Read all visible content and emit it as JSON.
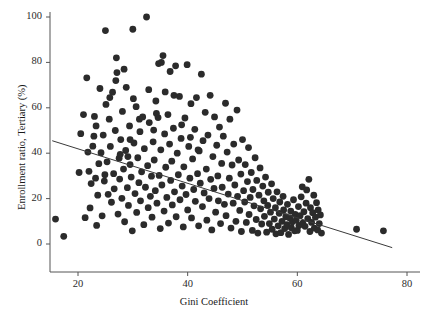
{
  "chart_data": {
    "type": "scatter",
    "title": "",
    "xlabel": "Gini Coefficient",
    "ylabel": "Enrollment ratio, Tertiary (%)",
    "xlim": [
      14,
      80
    ],
    "ylim": [
      -5,
      103
    ],
    "xticks": [
      20,
      40,
      60,
      80
    ],
    "yticks": [
      0,
      20,
      40,
      60,
      80,
      100
    ],
    "grid": false,
    "legend": null,
    "marker_color": "#2b2b2b",
    "marker_size": 4.4,
    "axis_color": "#555555",
    "trendline": {
      "label": "linear fit",
      "color": "#3a3a3a",
      "x": [
        15.3,
        77.3
      ],
      "y": [
        45.5,
        -1.6
      ],
      "slope": -0.76,
      "intercept": 57.1
    },
    "series": [
      {
        "name": "Countries",
        "points": [
          [
            15.9,
            11.0
          ],
          [
            17.4,
            3.4
          ],
          [
            20.2,
            31.5
          ],
          [
            20.5,
            48.6
          ],
          [
            21.0,
            57.0
          ],
          [
            21.3,
            11.6
          ],
          [
            21.6,
            73.2
          ],
          [
            22.0,
            32.0
          ],
          [
            22.2,
            15.9
          ],
          [
            22.4,
            26.6
          ],
          [
            22.7,
            43.1
          ],
          [
            23.0,
            56.2
          ],
          [
            23.2,
            29.0
          ],
          [
            23.4,
            8.2
          ],
          [
            23.6,
            21.5
          ],
          [
            23.8,
            35.4
          ],
          [
            24.0,
            68.5
          ],
          [
            24.2,
            40.2
          ],
          [
            24.4,
            12.4
          ],
          [
            24.6,
            48.0
          ],
          [
            24.8,
            27.7
          ],
          [
            25.0,
            94.0
          ],
          [
            25.1,
            61.5
          ],
          [
            25.3,
            36.2
          ],
          [
            25.5,
            21.9
          ],
          [
            25.7,
            55.0
          ],
          [
            25.9,
            43.0
          ],
          [
            26.1,
            18.4
          ],
          [
            26.3,
            66.9
          ],
          [
            26.5,
            31.0
          ],
          [
            26.6,
            24.3
          ],
          [
            26.8,
            50.0
          ],
          [
            27.0,
            82.0
          ],
          [
            27.1,
            75.5
          ],
          [
            27.3,
            13.2
          ],
          [
            27.5,
            37.8
          ],
          [
            27.6,
            28.6
          ],
          [
            27.8,
            46.0
          ],
          [
            28.0,
            20.1
          ],
          [
            28.1,
            58.4
          ],
          [
            28.3,
            33.0
          ],
          [
            28.5,
            9.8
          ],
          [
            28.7,
            41.2
          ],
          [
            28.8,
            69.0
          ],
          [
            29.0,
            24.8
          ],
          [
            29.2,
            17.0
          ],
          [
            29.4,
            52.0
          ],
          [
            29.5,
            35.0
          ],
          [
            29.7,
            29.5
          ],
          [
            29.9,
            5.8
          ],
          [
            30.0,
            94.6
          ],
          [
            30.2,
            44.5
          ],
          [
            30.4,
            22.2
          ],
          [
            30.6,
            60.5
          ],
          [
            30.7,
            13.9
          ],
          [
            30.9,
            38.0
          ],
          [
            31.1,
            27.0
          ],
          [
            31.3,
            49.5
          ],
          [
            31.4,
            19.0
          ],
          [
            31.6,
            31.8
          ],
          [
            31.8,
            56.0
          ],
          [
            32.0,
            8.5
          ],
          [
            32.1,
            42.0
          ],
          [
            32.3,
            25.0
          ],
          [
            32.5,
            100.0
          ],
          [
            32.7,
            34.5
          ],
          [
            32.8,
            16.0
          ],
          [
            33.0,
            53.5
          ],
          [
            33.2,
            21.0
          ],
          [
            33.4,
            29.9
          ],
          [
            33.5,
            11.8
          ],
          [
            33.7,
            45.0
          ],
          [
            33.9,
            37.0
          ],
          [
            34.1,
            23.5
          ],
          [
            34.2,
            63.0
          ],
          [
            34.4,
            18.0
          ],
          [
            34.6,
            55.7
          ],
          [
            34.8,
            30.2
          ],
          [
            35.0,
            6.8
          ],
          [
            35.1,
            41.5
          ],
          [
            35.3,
            26.0
          ],
          [
            35.5,
            83.0
          ],
          [
            35.7,
            14.5
          ],
          [
            35.8,
            48.5
          ],
          [
            36.0,
            33.8
          ],
          [
            36.2,
            20.5
          ],
          [
            36.4,
            57.0
          ],
          [
            36.5,
            9.2
          ],
          [
            36.7,
            44.0
          ],
          [
            36.9,
            28.0
          ],
          [
            37.1,
            36.5
          ],
          [
            37.2,
            17.2
          ],
          [
            37.4,
            51.0
          ],
          [
            37.6,
            23.0
          ],
          [
            37.8,
            78.5
          ],
          [
            37.9,
            12.0
          ],
          [
            38.1,
            40.0
          ],
          [
            38.3,
            30.5
          ],
          [
            38.5,
            65.0
          ],
          [
            38.6,
            19.5
          ],
          [
            38.8,
            46.5
          ],
          [
            39.0,
            25.5
          ],
          [
            39.2,
            7.5
          ],
          [
            39.3,
            34.0
          ],
          [
            39.5,
            55.5
          ],
          [
            39.7,
            21.8
          ],
          [
            39.9,
            79.0
          ],
          [
            40.0,
            15.0
          ],
          [
            40.2,
            43.0
          ],
          [
            40.4,
            29.0
          ],
          [
            40.6,
            61.8
          ],
          [
            40.7,
            11.5
          ],
          [
            40.9,
            37.5
          ],
          [
            41.1,
            24.0
          ],
          [
            41.3,
            50.5
          ],
          [
            41.4,
            18.8
          ],
          [
            41.6,
            64.5
          ],
          [
            41.8,
            31.0
          ],
          [
            42.0,
            8.0
          ],
          [
            42.1,
            41.0
          ],
          [
            42.3,
            26.8
          ],
          [
            42.5,
            74.8
          ],
          [
            42.7,
            16.5
          ],
          [
            42.8,
            45.5
          ],
          [
            43.0,
            22.5
          ],
          [
            43.2,
            58.0
          ],
          [
            43.4,
            33.0
          ],
          [
            43.5,
            10.5
          ],
          [
            43.7,
            48.0
          ],
          [
            43.9,
            20.0
          ],
          [
            44.1,
            65.5
          ],
          [
            44.2,
            28.5
          ],
          [
            44.4,
            6.2
          ],
          [
            44.6,
            38.5
          ],
          [
            44.8,
            24.5
          ],
          [
            44.9,
            56.0
          ],
          [
            45.1,
            14.0
          ],
          [
            45.3,
            43.5
          ],
          [
            45.5,
            30.0
          ],
          [
            45.6,
            19.0
          ],
          [
            45.8,
            51.5
          ],
          [
            46.0,
            9.0
          ],
          [
            46.2,
            35.5
          ],
          [
            46.3,
            25.0
          ],
          [
            46.5,
            47.5
          ],
          [
            46.7,
            17.5
          ],
          [
            46.9,
            62.0
          ],
          [
            47.0,
            12.5
          ],
          [
            47.2,
            40.5
          ],
          [
            47.4,
            22.0
          ],
          [
            47.6,
            29.0
          ],
          [
            47.7,
            55.0
          ],
          [
            47.9,
            7.0
          ],
          [
            48.1,
            34.8
          ],
          [
            48.3,
            18.0
          ],
          [
            48.4,
            44.0
          ],
          [
            48.6,
            26.0
          ],
          [
            48.8,
            10.0
          ],
          [
            49.0,
            59.0
          ],
          [
            49.1,
            21.0
          ],
          [
            49.3,
            37.0
          ],
          [
            49.5,
            14.8
          ],
          [
            49.7,
            30.8
          ],
          [
            49.8,
            5.5
          ],
          [
            50.0,
            46.0
          ],
          [
            50.2,
            23.5
          ],
          [
            50.4,
            18.5
          ],
          [
            50.5,
            35.0
          ],
          [
            50.7,
            9.5
          ],
          [
            50.9,
            27.5
          ],
          [
            51.1,
            42.5
          ],
          [
            51.2,
            13.0
          ],
          [
            51.4,
            20.5
          ],
          [
            51.6,
            31.5
          ],
          [
            51.8,
            6.0
          ],
          [
            51.9,
            24.0
          ],
          [
            52.1,
            16.8
          ],
          [
            52.3,
            38.0
          ],
          [
            52.5,
            10.8
          ],
          [
            52.6,
            28.0
          ],
          [
            52.8,
            4.8
          ],
          [
            53.0,
            21.5
          ],
          [
            53.2,
            33.5
          ],
          [
            53.3,
            15.5
          ],
          [
            53.5,
            8.8
          ],
          [
            53.7,
            25.5
          ],
          [
            53.9,
            19.0
          ],
          [
            54.0,
            12.2
          ],
          [
            54.2,
            29.5
          ],
          [
            54.4,
            5.2
          ],
          [
            54.6,
            17.0
          ],
          [
            54.7,
            22.8
          ],
          [
            54.9,
            9.0
          ],
          [
            55.1,
            14.0
          ],
          [
            55.3,
            26.5
          ],
          [
            55.4,
            6.5
          ],
          [
            55.6,
            20.0
          ],
          [
            55.8,
            11.0
          ],
          [
            56.0,
            16.0
          ],
          [
            56.1,
            4.5
          ],
          [
            56.3,
            23.0
          ],
          [
            56.5,
            8.0
          ],
          [
            56.7,
            13.5
          ],
          [
            56.8,
            18.5
          ],
          [
            57.0,
            5.0
          ],
          [
            57.2,
            10.0
          ],
          [
            57.4,
            21.0
          ],
          [
            57.5,
            15.0
          ],
          [
            57.7,
            6.8
          ],
          [
            57.9,
            12.0
          ],
          [
            58.1,
            8.5
          ],
          [
            58.2,
            17.5
          ],
          [
            58.4,
            4.2
          ],
          [
            58.6,
            11.5
          ],
          [
            58.8,
            14.5
          ],
          [
            58.9,
            7.2
          ],
          [
            59.1,
            9.8
          ],
          [
            59.3,
            19.5
          ],
          [
            59.5,
            5.8
          ],
          [
            59.6,
            13.0
          ],
          [
            59.8,
            10.5
          ],
          [
            60.0,
            6.0
          ],
          [
            60.2,
            16.5
          ],
          [
            60.3,
            8.2
          ],
          [
            60.5,
            12.5
          ],
          [
            60.7,
            20.8
          ],
          [
            60.9,
            25.2
          ],
          [
            61.0,
            9.2
          ],
          [
            61.2,
            14.2
          ],
          [
            61.4,
            7.8
          ],
          [
            61.6,
            18.0
          ],
          [
            61.7,
            23.8
          ],
          [
            61.9,
            11.2
          ],
          [
            62.1,
            28.5
          ],
          [
            62.3,
            5.5
          ],
          [
            62.4,
            16.0
          ],
          [
            62.6,
            9.5
          ],
          [
            62.8,
            13.8
          ],
          [
            63.0,
            21.5
          ],
          [
            63.1,
            7.0
          ],
          [
            63.3,
            11.8
          ],
          [
            63.5,
            18.2
          ],
          [
            63.7,
            6.2
          ],
          [
            63.8,
            15.0
          ],
          [
            64.0,
            9.0
          ],
          [
            64.2,
            12.8
          ],
          [
            64.4,
            4.8
          ],
          [
            70.8,
            6.5
          ],
          [
            75.7,
            5.8
          ],
          [
            29.5,
            46.0
          ],
          [
            31.2,
            55.0
          ],
          [
            33.8,
            50.2
          ],
          [
            35.9,
            67.0
          ],
          [
            30.1,
            64.0
          ],
          [
            28.4,
            77.0
          ],
          [
            26.9,
            72.0
          ],
          [
            34.7,
            79.5
          ],
          [
            35.2,
            80.0
          ],
          [
            36.8,
            76.0
          ],
          [
            37.5,
            65.5
          ],
          [
            38.9,
            52.5
          ],
          [
            40.5,
            47.0
          ],
          [
            41.9,
            41.5
          ],
          [
            25.8,
            64.5
          ],
          [
            27.7,
            39.5
          ],
          [
            29.1,
            38.5
          ],
          [
            32.9,
            68.0
          ],
          [
            34.3,
            57.5
          ],
          [
            24.9,
            30.5
          ],
          [
            22.9,
            47.5
          ],
          [
            21.8,
            40.5
          ],
          [
            23.3,
            52.0
          ]
        ]
      }
    ]
  },
  "axis_labels": {
    "y": [
      "100",
      "80",
      "60",
      "40",
      "20",
      "0"
    ],
    "x": [
      "20",
      "40",
      "60",
      "80"
    ]
  }
}
